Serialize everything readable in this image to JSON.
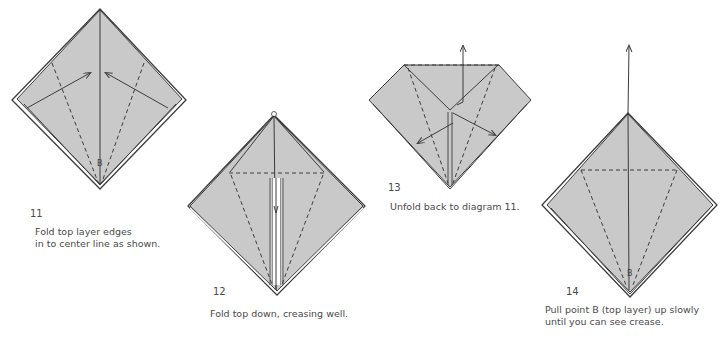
{
  "colors": {
    "paper_fill": "#c9c9c9",
    "line": "#3c3c3c",
    "background": "#ffffff"
  },
  "steps": [
    {
      "number": "11",
      "label": "B",
      "caption_lines": [
        "Fold top layer edges",
        "in to center line as shown."
      ]
    },
    {
      "number": "12",
      "caption_lines": [
        "Fold top down, creasing well."
      ]
    },
    {
      "number": "13",
      "caption_lines": [
        "Unfold back to diagram 11."
      ]
    },
    {
      "number": "14",
      "label": "B",
      "caption_lines": [
        "Pull point B (top layer) up slowly",
        "until you can see crease."
      ]
    }
  ]
}
